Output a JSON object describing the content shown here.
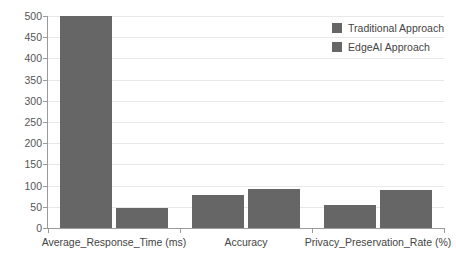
{
  "chart_data": {
    "type": "bar",
    "title": "",
    "subtitle": "",
    "xlabel": "",
    "ylabel": "",
    "categories": [
      "Average_Response_Time (ms)",
      "Accuracy",
      "Privacy_Preservation_Rate (%)"
    ],
    "series": [
      {
        "name": "Traditional Approach",
        "color": "#666666",
        "values": [
          500,
          78,
          54
        ]
      },
      {
        "name": "EdgeAI Approach",
        "color": "#666666",
        "values": [
          48,
          91,
          89
        ]
      }
    ],
    "ylim": [
      0,
      500
    ],
    "ytick_values": [
      0,
      50,
      100,
      150,
      200,
      250,
      300,
      350,
      400,
      450,
      500
    ],
    "ytick_labels": [
      "0",
      "50",
      "100",
      "150",
      "200",
      "250",
      "300",
      "350",
      "400",
      "450",
      "500"
    ],
    "grid": "horizontal",
    "legend_position": "top-right",
    "annotations": []
  },
  "legend": {
    "entries": [
      {
        "label": "Traditional Approach",
        "swatch": "legend-swatch-traditional"
      },
      {
        "label": "EdgeAI Approach",
        "swatch": "legend-swatch-edgeai"
      }
    ]
  },
  "axis": {
    "y_ticks": [
      "500",
      "450",
      "400",
      "350",
      "300",
      "250",
      "200",
      "150",
      "100",
      "50",
      "0"
    ],
    "x_labels": [
      "Average_Response_Time (ms)",
      "Accuracy",
      "Privacy_Preservation_Rate (%)"
    ]
  },
  "colors": {
    "bar": "#666666",
    "grid": "#e8e8e8",
    "axis": "#9a9a9a",
    "text": "#444444",
    "tick_text": "#555555",
    "background": "#ffffff"
  }
}
